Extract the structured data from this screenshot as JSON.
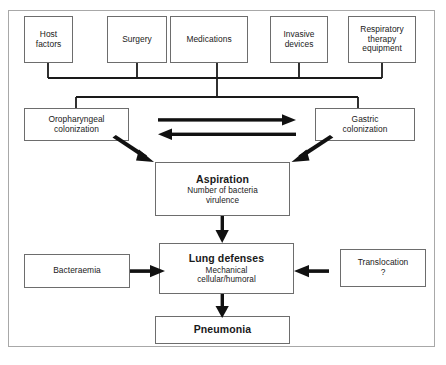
{
  "diagram": {
    "frame_color": "#a8a8a8",
    "box_border_color": "#6d6d6d",
    "connector_color": "#1a1a1a",
    "nodes": {
      "host_factors": {
        "line1": "Host",
        "line2": "factors"
      },
      "surgery": {
        "line1": "Surgery"
      },
      "medications": {
        "line1": "Medications"
      },
      "invasive_devices": {
        "line1": "Invasive",
        "line2": "devices"
      },
      "respiratory_therapy_equipment": {
        "line1": "Respiratory",
        "line2": "therapy",
        "line3": "equipment"
      },
      "oropharyngeal_colonization": {
        "line1": "Oropharyngeal",
        "line2": "colonization"
      },
      "gastric_colonization": {
        "line1": "Gastric",
        "line2": "colonization"
      },
      "aspiration": {
        "title": "Aspiration",
        "line1": "Number of bacteria",
        "line2": "virulence"
      },
      "bacteraemia": {
        "line1": "Bacteraemia"
      },
      "translocation": {
        "line1": "Translocation",
        "line2": "?"
      },
      "lung_defenses": {
        "title": "Lung defenses",
        "line1": "Mechanical",
        "line2": "cellular/humoral"
      },
      "pneumonia": {
        "title": "Pneumonia"
      }
    },
    "connectors": [
      {
        "name": "host-factors-to-bus",
        "type": "line"
      },
      {
        "name": "surgery-to-bus",
        "type": "line"
      },
      {
        "name": "medications-to-bus",
        "type": "line"
      },
      {
        "name": "invasive-devices-to-bus",
        "type": "line"
      },
      {
        "name": "respiratory-therapy-to-bus",
        "type": "line"
      },
      {
        "name": "bus-to-colonization-split",
        "type": "line"
      },
      {
        "name": "oropharyngeal-to-gastric",
        "type": "arrow-right"
      },
      {
        "name": "gastric-to-oropharyngeal",
        "type": "arrow-left"
      },
      {
        "name": "oropharyngeal-to-aspiration",
        "type": "arrow-diagonal"
      },
      {
        "name": "gastric-to-aspiration",
        "type": "arrow-diagonal"
      },
      {
        "name": "aspiration-to-lung-defenses",
        "type": "arrow-down"
      },
      {
        "name": "bacteraemia-to-lung-defenses",
        "type": "arrow-right"
      },
      {
        "name": "translocation-to-lung-defenses",
        "type": "arrow-left"
      },
      {
        "name": "lung-defenses-to-pneumonia",
        "type": "arrow-down"
      }
    ]
  }
}
